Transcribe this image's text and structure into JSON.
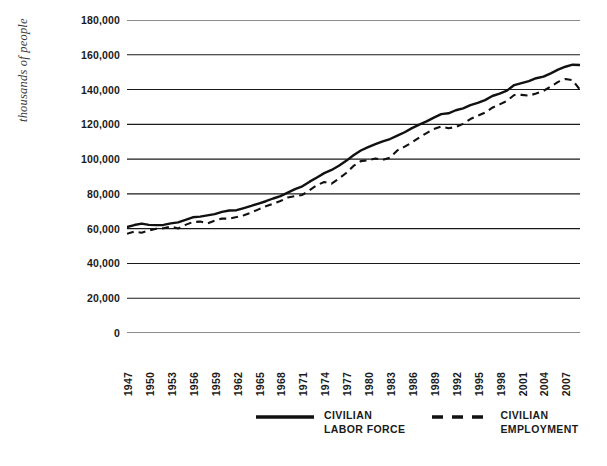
{
  "chart_data": {
    "type": "line",
    "title": "",
    "xlabel": "",
    "ylabel": "thousands of people",
    "ylim": [
      0,
      180000
    ],
    "xlim": [
      1947,
      2009
    ],
    "grid": true,
    "legend_position": "bottom-center",
    "ytick_labels": [
      "180,000",
      "160,000",
      "140,000",
      "120,000",
      "100,000",
      "80,000",
      "60,000",
      "40,000",
      "20,000",
      "0"
    ],
    "ytick_values": [
      180000,
      160000,
      140000,
      120000,
      100000,
      80000,
      60000,
      40000,
      20000,
      0
    ],
    "xtick_labels": [
      "1947",
      "1950",
      "1953",
      "1956",
      "1959",
      "1962",
      "1965",
      "1968",
      "1971",
      "1974",
      "1977",
      "1980",
      "1983",
      "1986",
      "1989",
      "1992",
      "1995",
      "1998",
      "2001",
      "2004",
      "2007"
    ],
    "xtick_values": [
      1947,
      1950,
      1953,
      1956,
      1959,
      1962,
      1965,
      1968,
      1971,
      1974,
      1977,
      1980,
      1983,
      1986,
      1989,
      1992,
      1995,
      1998,
      2001,
      2004,
      2007
    ],
    "x": [
      1947,
      1948,
      1949,
      1950,
      1951,
      1952,
      1953,
      1954,
      1955,
      1956,
      1957,
      1958,
      1959,
      1960,
      1961,
      1962,
      1963,
      1964,
      1965,
      1966,
      1967,
      1968,
      1969,
      1970,
      1971,
      1972,
      1973,
      1974,
      1975,
      1976,
      1977,
      1978,
      1979,
      1980,
      1981,
      1982,
      1983,
      1984,
      1985,
      1986,
      1987,
      1988,
      1989,
      1990,
      1991,
      1992,
      1993,
      1994,
      1995,
      1996,
      1997,
      1998,
      1999,
      2000,
      2001,
      2002,
      2003,
      2004,
      2005,
      2006,
      2007,
      2008,
      2009
    ],
    "series": [
      {
        "name": "CIVILIAN LABOR FORCE",
        "label_line1": "CIVILIAN",
        "label_line2": "LABOR FORCE",
        "style": "solid",
        "color": "#111111",
        "values": [
          60941,
          62080,
          62903,
          62208,
          62017,
          62138,
          63015,
          63643,
          65023,
          66552,
          66929,
          67639,
          68369,
          69628,
          70459,
          70614,
          71833,
          73091,
          74455,
          75770,
          77347,
          78737,
          80734,
          82771,
          84382,
          87034,
          89429,
          91949,
          93775,
          96158,
          99009,
          102251,
          104962,
          106940,
          108670,
          110204,
          111550,
          113544,
          115461,
          117834,
          119865,
          121669,
          123869,
          125840,
          126346,
          128105,
          129200,
          131056,
          132304,
          133943,
          136297,
          137673,
          139368,
          142583,
          143734,
          144863,
          146510,
          147401,
          149320,
          151428,
          153124,
          154287,
          154142
        ],
        "description": "Total civilian labor force, rising from ~61 million in 1947 to ~154 million by 2007-2009"
      },
      {
        "name": "CIVILIAN EMPLOYMENT",
        "label_line1": "CIVILIAN",
        "label_line2": "EMPLOYMENT",
        "style": "dashed",
        "color": "#111111",
        "values": [
          57038,
          58343,
          57651,
          58918,
          59961,
          60250,
          61179,
          60109,
          62170,
          63799,
          64071,
          63036,
          64630,
          65778,
          65746,
          66702,
          67762,
          69305,
          71088,
          72895,
          74372,
          75920,
          77902,
          78678,
          79367,
          82153,
          85064,
          86794,
          85846,
          88752,
          92017,
          96048,
          98824,
          99303,
          100397,
          99526,
          100834,
          105005,
          107150,
          109597,
          112440,
          114968,
          117342,
          118793,
          117718,
          118492,
          120259,
          123060,
          124900,
          126708,
          129558,
          131463,
          133488,
          136891,
          136933,
          136485,
          137736,
          139252,
          141730,
          144427,
          146047,
          145362,
          139877
        ],
        "description": "Civilian employment, tracking below the labor force, flat in early 1980s recession, peaking ~146 million in 2007 then falling to ~140 million in 2009"
      }
    ]
  }
}
